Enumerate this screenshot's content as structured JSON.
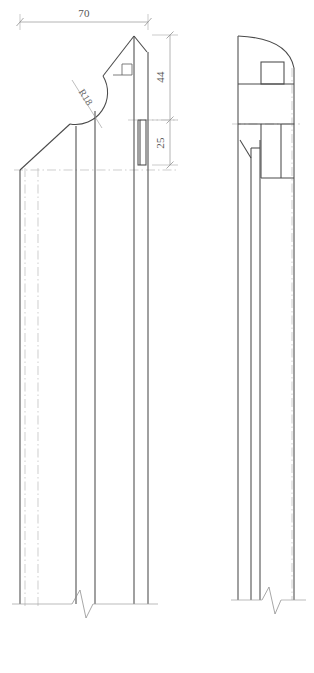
{
  "drawing": {
    "title": "Newel Post Profile Detail",
    "type": "engineering-orthographic-drawing",
    "views": [
      {
        "name": "front-elevation",
        "label": ""
      },
      {
        "name": "side-elevation",
        "label": ""
      }
    ],
    "dimensions": [
      {
        "name": "overall-width",
        "value": "70",
        "orientation": "horizontal",
        "position": "top",
        "extent_px": [
          20,
          148
        ]
      },
      {
        "name": "upper-height",
        "value": "44",
        "orientation": "vertical",
        "position": "right",
        "extent_px": [
          35,
          120
        ]
      },
      {
        "name": "lower-height",
        "value": "25",
        "orientation": "vertical",
        "position": "right",
        "extent_px": [
          120,
          165
        ]
      }
    ],
    "annotations": [
      {
        "name": "radius-callout",
        "value": "R18",
        "rotation_deg": 55,
        "description": "radius of concave cove cut on front profile"
      }
    ],
    "colors": {
      "object_line": "#4a4a4a",
      "thin_line": "#666666",
      "center_line": "#b9b9b9",
      "hidden_line": "#c4c4c4",
      "dimension_line": "#8c8c8c",
      "extension_line": "#a8a8a8",
      "text": "#555555",
      "background": "#ffffff"
    },
    "features": {
      "front": {
        "chamfer_angle": "45",
        "peak_notch": "square-tick-marker",
        "cove_radius": "R18",
        "break_symbol": "zigzag"
      },
      "side": {
        "top_profile": "convex-arc",
        "mortise": "square-pocket",
        "break_symbol": "zigzag"
      }
    }
  }
}
